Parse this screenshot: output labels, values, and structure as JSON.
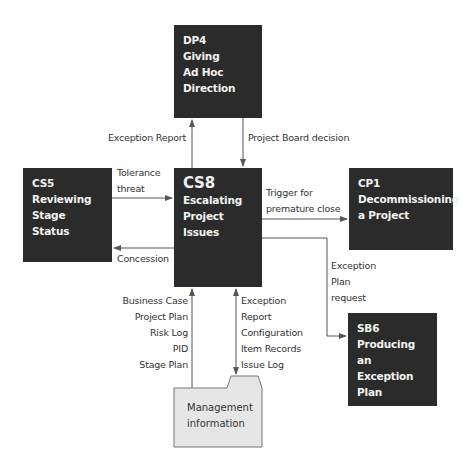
{
  "nodes": {
    "dp4": {
      "code": "DP4",
      "lines": [
        "Giving",
        "Ad Hoc",
        "Direction"
      ]
    },
    "cs8": {
      "code": "CS8",
      "lines": [
        "Escalating",
        "Project",
        "Issues"
      ]
    },
    "cs5": {
      "code": "CS5",
      "lines": [
        "Reviewing",
        "Stage",
        "Status"
      ]
    },
    "cp1": {
      "code": "CP1",
      "lines": [
        "Decommissioning",
        "a Project"
      ]
    },
    "sb6": {
      "code": "SB6",
      "lines": [
        "Producing an",
        "Exception",
        "Plan"
      ]
    },
    "mgmt": {
      "lines": [
        "Management",
        "information"
      ]
    }
  },
  "flows": {
    "exception_report": "Exception Report",
    "board_decision": "Project Board decision",
    "tolerance": [
      "Tolerance",
      "threat"
    ],
    "concession": "Concession",
    "trigger": [
      "Trigger for",
      "premature close"
    ],
    "exception_plan_request": [
      "Exception",
      "Plan",
      "request"
    ],
    "inputs_left": [
      "Business Case",
      "Project Plan",
      "Risk Log",
      "PID",
      "Stage Plan"
    ],
    "inputs_right": [
      "Exception",
      "Report",
      "Configuration",
      "Item Records",
      "Issue Log"
    ]
  },
  "colors": {
    "box": "#2b2b2b",
    "folder": "#e6e6e6",
    "line": "#555555"
  }
}
